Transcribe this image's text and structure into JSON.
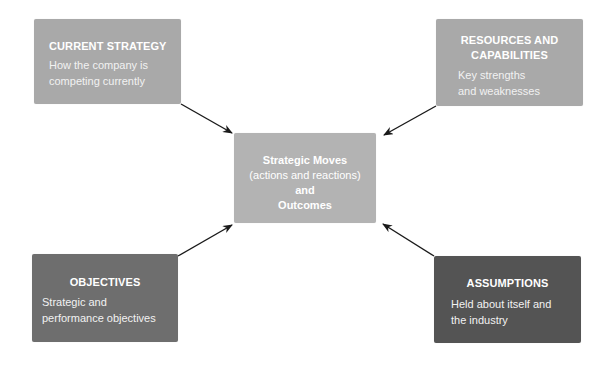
{
  "diagram": {
    "current_strategy": {
      "title": "CURRENT STRATEGY",
      "desc_line1": "How the company is",
      "desc_line2": "competing currently",
      "color": "#a9a9a9"
    },
    "resources": {
      "title_line1": "RESOURCES AND",
      "title_line2": "CAPABILITIES",
      "desc_line1": "Key strengths",
      "desc_line2": "and weaknesses",
      "color": "#a9a9a9"
    },
    "center": {
      "line1": "Strategic Moves",
      "line2": "(actions and reactions)",
      "line3": "and",
      "line4": "Outcomes",
      "color": "#b3b3b3"
    },
    "objectives": {
      "title": "OBJECTIVES",
      "desc_line1": "Strategic and",
      "desc_line2": "performance objectives",
      "color": "#6e6e6e"
    },
    "assumptions": {
      "title": "ASSUMPTIONS",
      "desc_line1": "Held about itself and",
      "desc_line2": "the industry",
      "color": "#545454"
    },
    "arrows": [
      {
        "from": "current_strategy",
        "to": "center"
      },
      {
        "from": "resources",
        "to": "center"
      },
      {
        "from": "objectives",
        "to": "center"
      },
      {
        "from": "assumptions",
        "to": "center"
      }
    ]
  }
}
